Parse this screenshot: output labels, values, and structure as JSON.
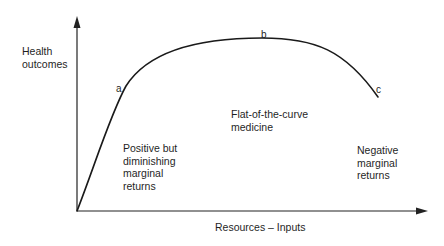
{
  "diagram": {
    "type": "curve",
    "axes": {
      "y_label": "Health\noutcomes",
      "x_label": "Resources – Inputs"
    },
    "points": {
      "a": "a",
      "b": "b",
      "c": "c"
    },
    "regions": {
      "left": "Positive but\ndiminishing\nmarginal\nreturns",
      "middle": "Flat-of-the-curve\nmedicine",
      "right": "Negative\nmarginal\nreturns"
    },
    "colors": {
      "line": "#1a1a1a",
      "text": "#1f1f1f",
      "background": "#ffffff"
    }
  }
}
